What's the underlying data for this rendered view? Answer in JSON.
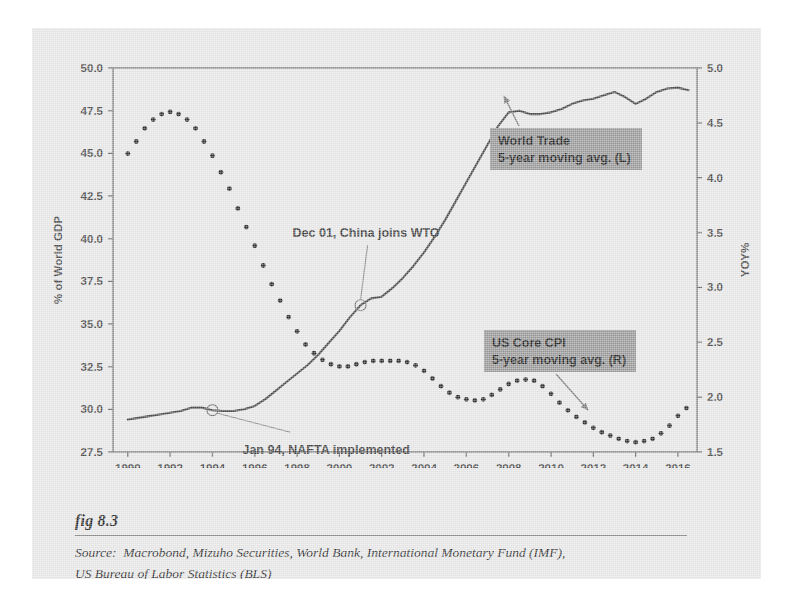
{
  "figure": {
    "label": "fig 8.3",
    "source_line_1": "Source:  Macrobond, Mizuho Securities, World Bank, International Monetary Fund (IMF),",
    "source_line_2": "US Bureau of Labor Statistics (BLS)"
  },
  "legend": {
    "world_trade": {
      "line1": "World Trade",
      "line2": "5-year moving avg. (L)"
    },
    "us_core_cpi": {
      "line1": "US Core CPI",
      "line2": "5-year moving avg. (R)"
    },
    "box_color": "#9a9a9a"
  },
  "annotations": [
    {
      "name": "china-wto",
      "text": "Dec 01, China joins WTO",
      "year": 2001.0,
      "value_left_axis": 36.1
    },
    {
      "name": "nafta",
      "text": "Jan 94, NAFTA implemented",
      "year": 1994.0,
      "value_left_axis": 29.95
    }
  ],
  "colors": {
    "page_background": "#e9e9e9",
    "plot_frame": "#6f6f6f",
    "world_trade_line": "#4a4a4a",
    "us_core_cpi_dots": "#2f2f2f",
    "legend_box": "#9a9a9a",
    "text": "#3d3d3d"
  },
  "chart_data": {
    "type": "line",
    "title": "",
    "xlabel": "",
    "ylabel": "% of World GDP",
    "y2label": "YOY%",
    "xlim": [
      1989.3,
      2016.9
    ],
    "ylim": [
      27.5,
      50.0
    ],
    "y2lim": [
      1.5,
      5.0
    ],
    "grid": false,
    "legend_position": "inside",
    "xticks": [
      1990,
      1992,
      1994,
      1996,
      1998,
      2000,
      2002,
      2004,
      2006,
      2008,
      2010,
      2012,
      2014,
      2016
    ],
    "xtick_labels": [
      "1990",
      "1992",
      "1994",
      "1996",
      "1998",
      "2000",
      "2002",
      "2004",
      "2006",
      "2008",
      "2010",
      "2012",
      "2014",
      "2016"
    ],
    "yticks": [
      27.5,
      30.0,
      32.5,
      35.0,
      37.5,
      40.0,
      42.5,
      45.0,
      47.5,
      50.0
    ],
    "ytick_labels": [
      "27.5",
      "30.0",
      "32.5",
      "35.0",
      "37.5",
      "40.0",
      "42.5",
      "45.0",
      "47.5",
      "50.0"
    ],
    "y2ticks": [
      1.5,
      2.0,
      2.5,
      3.0,
      3.5,
      4.0,
      4.5,
      5.0
    ],
    "y2tick_labels": [
      "1.5",
      "2.0",
      "2.5",
      "3.0",
      "3.5",
      "4.0",
      "4.5",
      "5.0"
    ],
    "series": [
      {
        "name": "World Trade 5-year moving avg. (L)",
        "axis": "left",
        "style": "solid-line",
        "x": [
          1990.0,
          1990.5,
          1991.0,
          1991.5,
          1992.0,
          1992.5,
          1993.0,
          1993.5,
          1994.0,
          1994.5,
          1995.0,
          1995.5,
          1996.0,
          1996.5,
          1997.0,
          1997.5,
          1998.0,
          1998.5,
          1999.0,
          1999.5,
          2000.0,
          2000.5,
          2001.0,
          2001.5,
          2002.0,
          2002.5,
          2003.0,
          2003.5,
          2004.0,
          2004.5,
          2005.0,
          2005.5,
          2006.0,
          2006.5,
          2007.0,
          2007.5,
          2008.0,
          2008.5,
          2009.0,
          2009.5,
          2010.0,
          2010.5,
          2011.0,
          2011.5,
          2012.0,
          2012.5,
          2013.0,
          2013.5,
          2014.0,
          2014.5,
          2015.0,
          2015.5,
          2016.0,
          2016.5
        ],
        "y": [
          29.4,
          29.5,
          29.6,
          29.7,
          29.8,
          29.9,
          30.1,
          30.1,
          29.95,
          29.9,
          29.9,
          30.0,
          30.2,
          30.6,
          31.1,
          31.6,
          32.1,
          32.6,
          33.2,
          33.9,
          34.6,
          35.4,
          36.1,
          36.5,
          36.6,
          37.1,
          37.7,
          38.4,
          39.2,
          40.1,
          41.1,
          42.2,
          43.3,
          44.4,
          45.5,
          46.6,
          47.4,
          47.5,
          47.3,
          47.3,
          47.4,
          47.6,
          47.9,
          48.1,
          48.2,
          48.4,
          48.6,
          48.3,
          47.9,
          48.2,
          48.6,
          48.8,
          48.85,
          48.7
        ]
      },
      {
        "name": "US Core CPI 5-year moving avg. (R)",
        "axis": "right",
        "style": "dotted",
        "x": [
          1990.0,
          1990.4,
          1990.8,
          1991.2,
          1991.6,
          1992.0,
          1992.4,
          1992.8,
          1993.2,
          1993.6,
          1994.0,
          1994.4,
          1994.8,
          1995.2,
          1995.6,
          1996.0,
          1996.4,
          1996.8,
          1997.2,
          1997.6,
          1998.0,
          1998.4,
          1998.8,
          1999.2,
          1999.6,
          2000.0,
          2000.4,
          2000.8,
          2001.2,
          2001.6,
          2002.0,
          2002.4,
          2002.8,
          2003.2,
          2003.6,
          2004.0,
          2004.4,
          2004.8,
          2005.2,
          2005.6,
          2006.0,
          2006.4,
          2006.8,
          2007.2,
          2007.6,
          2008.0,
          2008.4,
          2008.8,
          2009.2,
          2009.6,
          2010.0,
          2010.4,
          2010.8,
          2011.2,
          2011.6,
          2012.0,
          2012.4,
          2012.8,
          2013.2,
          2013.6,
          2014.0,
          2014.4,
          2014.8,
          2015.2,
          2015.6,
          2016.0,
          2016.4
        ],
        "y": [
          4.22,
          4.33,
          4.45,
          4.53,
          4.58,
          4.6,
          4.58,
          4.53,
          4.45,
          4.33,
          4.2,
          4.05,
          3.9,
          3.72,
          3.55,
          3.38,
          3.2,
          3.03,
          2.88,
          2.73,
          2.6,
          2.48,
          2.4,
          2.34,
          2.3,
          2.28,
          2.28,
          2.3,
          2.32,
          2.33,
          2.33,
          2.33,
          2.33,
          2.32,
          2.29,
          2.24,
          2.17,
          2.1,
          2.04,
          2.0,
          1.98,
          1.97,
          1.98,
          2.02,
          2.07,
          2.12,
          2.15,
          2.16,
          2.15,
          2.1,
          2.03,
          1.95,
          1.88,
          1.82,
          1.77,
          1.72,
          1.68,
          1.65,
          1.62,
          1.6,
          1.59,
          1.6,
          1.62,
          1.67,
          1.74,
          1.83,
          1.9
        ]
      }
    ]
  }
}
